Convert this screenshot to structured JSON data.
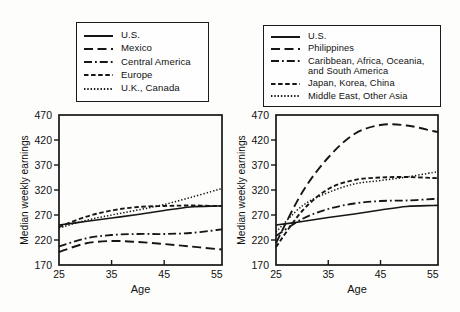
{
  "figure": {
    "background": "#fdfdfc",
    "ink": "#161616"
  },
  "chart_data": [
    {
      "type": "line",
      "panel": "left",
      "xlabel": "Age",
      "ylabel": "Median weekly earnings",
      "x": [
        25,
        30,
        35,
        40,
        45,
        50,
        55
      ],
      "xlim": [
        25,
        56
      ],
      "ylim": [
        170,
        470
      ],
      "xticks": [
        25,
        35,
        45,
        55
      ],
      "yticks": [
        170,
        220,
        270,
        320,
        370,
        420,
        470
      ],
      "grid": false,
      "legend_position": "top",
      "series": [
        {
          "name": "U.S.",
          "line_style": "solid",
          "values": [
            250,
            257,
            264,
            271,
            279,
            286,
            288
          ]
        },
        {
          "name": "Mexico",
          "line_style": "long-dash",
          "values": [
            196,
            213,
            218,
            216,
            212,
            207,
            202
          ]
        },
        {
          "name": "Central America",
          "line_style": "dash-dot",
          "values": [
            207,
            223,
            230,
            232,
            232,
            234,
            240
          ]
        },
        {
          "name": "Europe",
          "line_style": "short-dash",
          "values": [
            246,
            266,
            279,
            286,
            288,
            289,
            288
          ]
        },
        {
          "name": "U.K., Canada",
          "line_style": "dot",
          "values": [
            244,
            259,
            270,
            280,
            291,
            305,
            320
          ]
        }
      ]
    },
    {
      "type": "line",
      "panel": "right",
      "xlabel": "Age",
      "ylabel": "Median weekly earnings",
      "x": [
        25,
        30,
        35,
        40,
        45,
        50,
        55
      ],
      "xlim": [
        25,
        56
      ],
      "ylim": [
        170,
        470
      ],
      "xticks": [
        25,
        35,
        45,
        55
      ],
      "yticks": [
        170,
        220,
        270,
        320,
        370,
        420,
        470
      ],
      "grid": false,
      "legend_position": "top",
      "series": [
        {
          "name": "U.S.",
          "line_style": "solid",
          "values": [
            250,
            257,
            265,
            272,
            280,
            287,
            289
          ]
        },
        {
          "name": "Philippines",
          "line_style": "long-dash",
          "values": [
            214,
            315,
            385,
            432,
            450,
            449,
            438
          ]
        },
        {
          "name": "Caribbean, Africa, Oceania, and South America",
          "line_style": "dash-dot",
          "values": [
            228,
            262,
            282,
            293,
            298,
            299,
            302
          ]
        },
        {
          "name": "Japan, Korea, China",
          "line_style": "short-dash",
          "values": [
            206,
            278,
            322,
            340,
            345,
            346,
            344
          ]
        },
        {
          "name": "Middle East, Other Asia",
          "line_style": "dot",
          "values": [
            236,
            288,
            315,
            332,
            339,
            346,
            355
          ]
        }
      ]
    }
  ]
}
